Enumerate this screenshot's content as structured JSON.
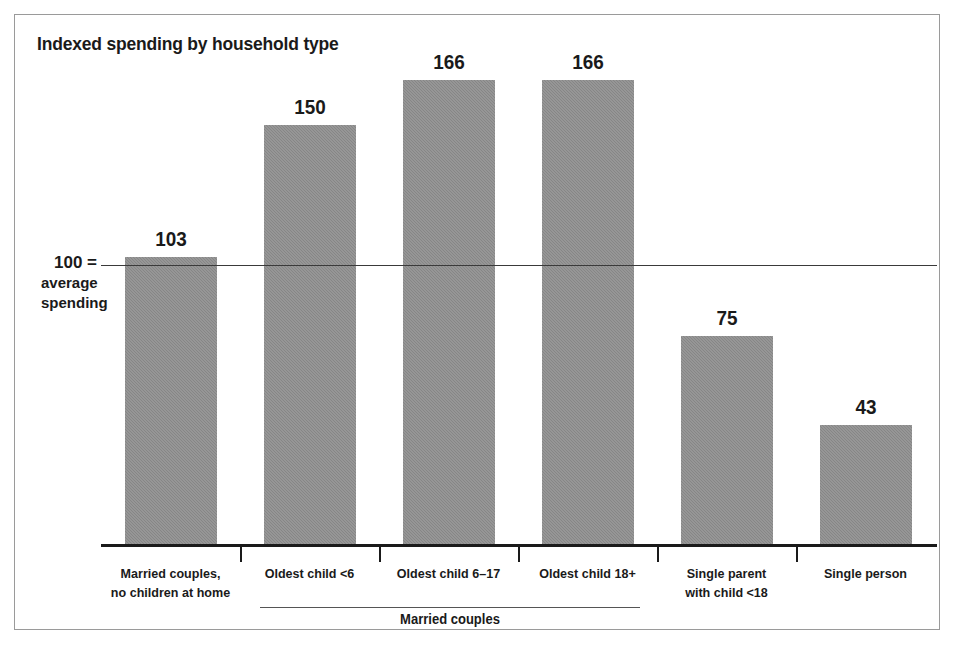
{
  "chart_data": {
    "type": "bar",
    "title": "Indexed spending by household type",
    "xlabel": "",
    "ylabel": "",
    "ylim": [
      0,
      180
    ],
    "grid": false,
    "legend": null,
    "reference_line": {
      "value": 100,
      "label_lines": [
        "100 =",
        "average",
        "spending"
      ]
    },
    "group_bracket": {
      "label": "Married couples",
      "covers": [
        "Oldest child <6",
        "Oldest child 6–17",
        "Oldest child 18+"
      ]
    },
    "categories": [
      "Married couples, no children at home",
      "Oldest child <6",
      "Oldest child 6–17",
      "Oldest child 18+",
      "Single parent with child <18",
      "Single person"
    ],
    "values": [
      103,
      150,
      166,
      166,
      75,
      43
    ],
    "colors": {
      "bar_fill": "#8d8d8d",
      "axis": "#1a1a1a",
      "reference_line": "#3a3a3a",
      "text": "#1a1a1a",
      "frame_border": "#9a9a9a",
      "background": "#ffffff"
    }
  },
  "bars": [
    {
      "label_lines": [
        "Married couples,",
        "no children at home"
      ],
      "value_label": "103",
      "value": 103
    },
    {
      "label_lines": [
        "Oldest child <6"
      ],
      "value_label": "150",
      "value": 150
    },
    {
      "label_lines": [
        "Oldest child 6–17"
      ],
      "value_label": "166",
      "value": 166
    },
    {
      "label_lines": [
        "Oldest child 18+"
      ],
      "value_label": "166",
      "value": 166
    },
    {
      "label_lines": [
        "Single parent",
        "with child <18"
      ],
      "value_label": "75",
      "value": 75
    },
    {
      "label_lines": [
        "Single person"
      ],
      "value_label": "43",
      "value": 43
    }
  ],
  "reference": {
    "line_1": "100 =",
    "line_2": "average",
    "line_3": "spending"
  },
  "group": {
    "label": "Married couples"
  }
}
